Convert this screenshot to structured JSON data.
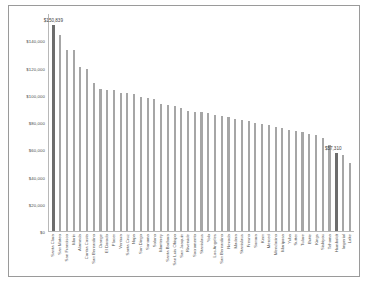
{
  "chart_data": {
    "type": "bar",
    "title": "",
    "xlabel": "",
    "ylabel": "",
    "ylim": [
      0,
      160000
    ],
    "grid": false,
    "legend": "none",
    "yticks": [
      "$0",
      "$20,000",
      "$40,000",
      "$60,000",
      "$80,000",
      "$100,000",
      "$120,000",
      "$140,000"
    ],
    "ytick_values": [
      0,
      20000,
      40000,
      60000,
      80000,
      100000,
      120000,
      140000
    ],
    "highlight_color": "#6d6d6d",
    "bar_color": "#a6a6a6",
    "annotations": [
      {
        "category": "Santa Clara",
        "text": "$150,839"
      },
      {
        "category": "Humboldt",
        "text": "$57,310"
      }
    ],
    "categories": [
      "Santa Clara",
      "San Mateo",
      "San Francisco",
      "Marin",
      "Alameda",
      "Contra Costa",
      "San Bernardino",
      "Orange",
      "El Dorado",
      "Placer",
      "Ventura",
      "Santa Cruz",
      "Napa",
      "San Diego",
      "Sonoma",
      "Solano",
      "Monterey",
      "Santa Barbara",
      "San Luis Obispo",
      "San Joaquin",
      "Riverside",
      "Sacramento",
      "Stanislaus",
      "Yolo",
      "Los Angeles",
      "San Bernardino",
      "Nevada",
      "Madera",
      "Stanislaus",
      "Fresno",
      "Sonora",
      "Kern",
      "Merced",
      "Mendocino",
      "Mariposa",
      "Yuba",
      "Sutter",
      "Tulare",
      "Butte",
      "Kings",
      "Siskiyou",
      "Tehama",
      "Humboldt",
      "Imperial",
      "Lake"
    ],
    "values": [
      150839,
      143500,
      133000,
      132800,
      120500,
      119000,
      108500,
      104000,
      103800,
      103500,
      101500,
      101000,
      100500,
      98000,
      97500,
      96800,
      93000,
      92800,
      92000,
      90500,
      88000,
      87500,
      87000,
      86500,
      85500,
      84500,
      83500,
      82500,
      81500,
      80500,
      79500,
      78500,
      77500,
      76500,
      75500,
      74500,
      73500,
      72500,
      71500,
      70500,
      68500,
      63000,
      57310,
      56000,
      50000
    ],
    "highlight_indices": [
      0,
      42
    ]
  }
}
